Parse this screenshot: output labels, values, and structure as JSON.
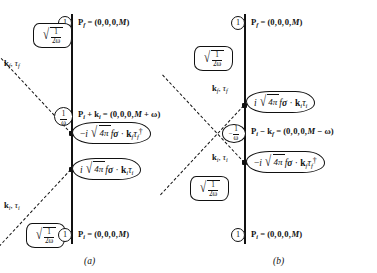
{
  "figure": {
    "background_color": "#ffffff",
    "ink_color": "#111111"
  },
  "panels": [
    {
      "id": "a",
      "caption": "(a)",
      "description": "Direct (s-channel) time-ordered diagram: incoming pion absorbed first, outgoing pion emitted later",
      "states": [
        {
          "name": "final-state",
          "renorm_factor": "1",
          "momentum_label": "P_f = (0, 0, 0, M)",
          "momentum_parts": {
            "symbol": "P",
            "subscript": "f",
            "equals": "=",
            "value": "(0, 0, 0, M)"
          }
        },
        {
          "name": "intermediate-state",
          "renorm_factor": "1/ω",
          "momentum_label": "P_i + k_i = (0, 0, 0, M + ω)",
          "momentum_parts": {
            "symbol": "P",
            "subscript": "i",
            "plus": "+ k",
            "plus_subscript": "i",
            "equals": "=",
            "value": "(0, 0, 0, M + ω)"
          }
        },
        {
          "name": "initial-state",
          "renorm_factor": "1",
          "momentum_label": "P_i = (0, 0, 0, M)",
          "momentum_parts": {
            "symbol": "P",
            "subscript": "i",
            "equals": "=",
            "value": "(0, 0, 0, M)"
          }
        }
      ],
      "pion_lines": [
        {
          "name": "outgoing-pion",
          "label": "k_f , τ_f",
          "normalization": "sqrt(1/(2ω))",
          "direction": "upper-left"
        },
        {
          "name": "incoming-pion",
          "label": "k_i , τ_i",
          "normalization": "sqrt(1/(2ω))",
          "direction": "lower-left"
        }
      ],
      "vertices": [
        {
          "name": "emission-vertex",
          "expression": "-i √(4π) f σ · k_f τ_f†",
          "sign": "-i",
          "coupling": "4π",
          "f": "f",
          "operator": "σ · k",
          "momentum_sub": "f",
          "isospin": "τ",
          "isospin_sub": "f",
          "dagger": true
        },
        {
          "name": "absorption-vertex",
          "expression": "i √(4π) f σ · k_i τ_i",
          "sign": "i",
          "coupling": "4π",
          "f": "f",
          "operator": "σ · k",
          "momentum_sub": "i",
          "isospin": "τ",
          "isospin_sub": "i",
          "dagger": false
        }
      ]
    },
    {
      "id": "b",
      "caption": "(b)",
      "description": "Crossed (u-channel) time-ordered diagram: outgoing pion emitted first, incoming pion absorbed later",
      "states": [
        {
          "name": "final-state",
          "renorm_factor": "1",
          "momentum_label": "P_f = (0, 0, 0, M)",
          "momentum_parts": {
            "symbol": "P",
            "subscript": "f",
            "equals": "=",
            "value": "(0, 0, 0, M)"
          }
        },
        {
          "name": "intermediate-state",
          "renorm_factor": "-1/ω",
          "momentum_label": "P_i - k_f = (0, 0, 0, M - ω)",
          "momentum_parts": {
            "symbol": "P",
            "subscript": "i",
            "minus": "− k",
            "minus_subscript": "f",
            "equals": "=",
            "value": "(0, 0, 0, M − ω)"
          }
        },
        {
          "name": "initial-state",
          "renorm_factor": "1",
          "momentum_label": "P_i = (0, 0, 0, M)",
          "momentum_parts": {
            "symbol": "P",
            "subscript": "i",
            "equals": "=",
            "value": "(0, 0, 0, M)"
          }
        }
      ],
      "pion_lines": [
        {
          "name": "outgoing-pion",
          "label": "k_f , τ_f",
          "normalization": "sqrt(1/(2ω))",
          "direction": "upper-left"
        },
        {
          "name": "incoming-pion",
          "label": "k_i , τ_i",
          "normalization": "sqrt(1/(2ω))",
          "direction": "lower-left"
        }
      ],
      "vertices": [
        {
          "name": "absorption-vertex",
          "expression": "i √(4π) f σ · k_i τ_i",
          "sign": "i",
          "coupling": "4π",
          "f": "f",
          "operator": "σ · k",
          "momentum_sub": "i",
          "isospin": "τ",
          "isospin_sub": "i",
          "dagger": false
        },
        {
          "name": "emission-vertex",
          "expression": "-i √(4π) f σ · k_f τ_f†",
          "sign": "-i",
          "coupling": "4π",
          "f": "f",
          "operator": "σ · k",
          "momentum_sub": "f",
          "isospin": "τ",
          "isospin_sub": "f",
          "dagger": true
        }
      ]
    }
  ],
  "symbols": {
    "one": "1",
    "omega": "ω",
    "two_omega": "2ω",
    "radical": "√",
    "sigma": "σ",
    "dot": "·",
    "dagger": "†",
    "tau": "τ",
    "k": "k",
    "P": "P",
    "f_coupling": "f",
    "four_pi": "4π",
    "minus_i": "−i",
    "i": "i",
    "comma": ","
  }
}
